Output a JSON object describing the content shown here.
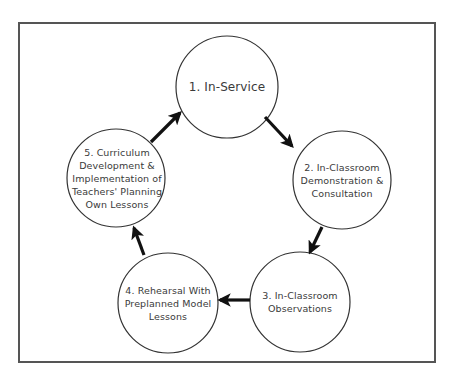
{
  "diagram": {
    "type": "cycle",
    "frame": {
      "stroke": "#555555"
    },
    "node_style": {
      "stroke": "#333333",
      "fill": "#ffffff",
      "text_color": "#3a3a3a"
    },
    "arrow_style": {
      "color": "#111111"
    },
    "nodes": [
      {
        "id": "n1",
        "label": "1.  In-Service"
      },
      {
        "id": "n2",
        "label": "2.  In-Classroom\nDemonstration &\nConsultation"
      },
      {
        "id": "n3",
        "label": "3.  In-Classroom\nObservations"
      },
      {
        "id": "n4",
        "label": "4.  Rehearsal With\nPreplanned Model\nLessons"
      },
      {
        "id": "n5",
        "label": "5.  Curriculum\nDevelopment &\nImplementation of\nTeachers' Planning\nOwn Lessons"
      }
    ],
    "edges": [
      {
        "from": "n1",
        "to": "n2"
      },
      {
        "from": "n2",
        "to": "n3"
      },
      {
        "from": "n3",
        "to": "n4"
      },
      {
        "from": "n4",
        "to": "n5"
      },
      {
        "from": "n5",
        "to": "n1"
      }
    ]
  }
}
